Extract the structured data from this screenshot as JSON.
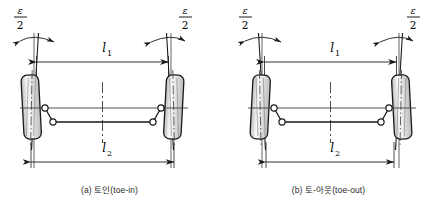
{
  "figure": {
    "title_note": "Wheel alignment toe angle diagram",
    "background_color": "#ffffff",
    "line_color": "#1a1a1a",
    "centerline_color": "#3c3c3c",
    "tire_fill_light": "#f2f2f2",
    "tire_fill_mid": "#d8d8d8",
    "tire_fill_dark": "#bdbdbd"
  },
  "panels": [
    {
      "id": "a",
      "caption": "(a) 토인(toe-in)",
      "angle_label_left": {
        "numerator": "ε",
        "denominator": "2"
      },
      "angle_label_right": {
        "numerator": "ε",
        "denominator": "2"
      },
      "dim_top": {
        "symbol": "l",
        "subscript": "1"
      },
      "dim_bottom": {
        "symbol": "l",
        "subscript": "2"
      },
      "toe_direction": "in",
      "relation": "l1 < l2"
    },
    {
      "id": "b",
      "caption": "(b) 토-아웃(toe-out)",
      "angle_label_left": {
        "numerator": "ε",
        "denominator": "2"
      },
      "angle_label_right": {
        "numerator": "ε",
        "denominator": "2"
      },
      "dim_top": {
        "symbol": "l",
        "subscript": "1"
      },
      "dim_bottom": {
        "symbol": "l",
        "subscript": "2"
      },
      "toe_direction": "out",
      "relation": "l1 > l2"
    }
  ]
}
